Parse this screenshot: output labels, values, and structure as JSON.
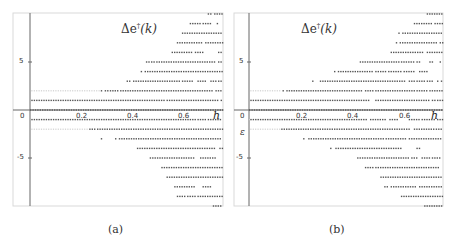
{
  "chart_data": [
    {
      "type": "scatter",
      "panel": "a",
      "title": "Δe†(k)",
      "xlabel": "h",
      "ylabel": "",
      "caption": "(a)",
      "xlim": [
        0,
        0.75
      ],
      "ylim": [
        -10,
        10
      ],
      "x_ticks": [
        "0.2",
        "0.4",
        "0.6"
      ],
      "y_ticks": [
        "5",
        "0",
        "-5"
      ],
      "grid": false,
      "description": "Horizontal rows of dots at integer levels; each row lists h-intervals where dots are present",
      "rows": [
        {
          "level": 10,
          "segments": [
            [
              0.69,
              0.705
            ],
            [
              0.715,
              0.75
            ]
          ]
        },
        {
          "level": 9,
          "segments": [
            [
              0.62,
              0.66
            ],
            [
              0.67,
              0.705
            ],
            [
              0.725,
              0.73
            ]
          ]
        },
        {
          "level": 8,
          "segments": [
            [
              0.59,
              0.75
            ]
          ]
        },
        {
          "level": 7,
          "segments": [
            [
              0.57,
              0.67
            ],
            [
              0.68,
              0.75
            ]
          ]
        },
        {
          "level": 6,
          "segments": [
            [
              0.55,
              0.63
            ],
            [
              0.64,
              0.67
            ],
            [
              0.73,
              0.75
            ]
          ]
        },
        {
          "level": 5,
          "segments": [
            [
              0.45,
              0.46
            ],
            [
              0.47,
              0.48
            ],
            [
              0.49,
              0.72
            ],
            [
              0.73,
              0.75
            ]
          ]
        },
        {
          "level": 4,
          "segments": [
            [
              0.43,
              0.435
            ],
            [
              0.445,
              0.75
            ]
          ]
        },
        {
          "level": 3,
          "segments": [
            [
              0.375,
              0.39
            ],
            [
              0.4,
              0.58
            ],
            [
              0.59,
              0.63
            ],
            [
              0.65,
              0.68
            ],
            [
              0.7,
              0.72
            ],
            [
              0.73,
              0.75
            ]
          ]
        },
        {
          "level": 2,
          "segments": [
            [
              0.275,
              0.28
            ],
            [
              0.29,
              0.3
            ],
            [
              0.31,
              0.34
            ],
            [
              0.35,
              0.71
            ],
            [
              0.72,
              0.75
            ]
          ]
        },
        {
          "level": 1,
          "segments": [
            [
              0.005,
              0.52
            ],
            [
              0.53,
              0.73
            ],
            [
              0.74,
              0.75
            ]
          ]
        },
        {
          "level": 0,
          "segments": [
            [
              0.0,
              0.75
            ]
          ]
        },
        {
          "level": -1,
          "segments": [
            [
              0.005,
              0.64
            ],
            [
              0.65,
              0.68
            ],
            [
              0.69,
              0.75
            ]
          ]
        },
        {
          "level": -2,
          "segments": [
            [
              0.23,
              0.25
            ],
            [
              0.26,
              0.75
            ]
          ]
        },
        {
          "level": -3,
          "segments": [
            [
              0.275,
              0.28
            ],
            [
              0.33,
              0.335
            ],
            [
              0.345,
              0.75
            ]
          ]
        },
        {
          "level": -4,
          "segments": [
            [
              0.415,
              0.72
            ],
            [
              0.735,
              0.75
            ]
          ]
        },
        {
          "level": -5,
          "segments": [
            [
              0.465,
              0.64
            ],
            [
              0.66,
              0.72
            ]
          ]
        },
        {
          "level": -6,
          "segments": [
            [
              0.51,
              0.75
            ]
          ]
        },
        {
          "level": -7,
          "segments": [
            [
              0.53,
              0.75
            ]
          ]
        },
        {
          "level": -8,
          "segments": [
            [
              0.56,
              0.64
            ],
            [
              0.67,
              0.7
            ]
          ]
        },
        {
          "level": -9,
          "segments": [
            [
              0.57,
              0.6
            ],
            [
              0.61,
              0.64
            ],
            [
              0.65,
              0.75
            ]
          ]
        },
        {
          "level": -10,
          "segments": [
            [
              0.71,
              0.75
            ]
          ]
        }
      ],
      "faint_rows": [
        {
          "level": 2,
          "segments": [
            [
              0.005,
              0.27
            ]
          ]
        },
        {
          "level": -2,
          "segments": [
            [
              0.005,
              0.22
            ]
          ]
        }
      ]
    },
    {
      "type": "scatter",
      "panel": "b",
      "title": "Δe†(k)",
      "xlabel": "h",
      "ylabel": "",
      "caption": "(b)",
      "extra_label": "ε",
      "xlim": [
        0,
        0.75
      ],
      "ylim": [
        -10,
        10
      ],
      "x_ticks": [
        "0.2",
        "0.4",
        "0.6"
      ],
      "y_ticks": [
        "5",
        "0",
        "-5"
      ],
      "grid": false,
      "rows": [
        {
          "level": 10,
          "segments": [
            [
              0.69,
              0.75
            ]
          ]
        },
        {
          "level": 9,
          "segments": [
            [
              0.64,
              0.71
            ],
            [
              0.72,
              0.75
            ]
          ]
        },
        {
          "level": 8,
          "segments": [
            [
              0.58,
              0.585
            ],
            [
              0.595,
              0.75
            ]
          ]
        },
        {
          "level": 7,
          "segments": [
            [
              0.57,
              0.575
            ],
            [
              0.585,
              0.73
            ],
            [
              0.74,
              0.75
            ]
          ]
        },
        {
          "level": 6,
          "segments": [
            [
              0.55,
              0.68
            ],
            [
              0.69,
              0.75
            ]
          ]
        },
        {
          "level": 5,
          "segments": [
            [
              0.43,
              0.58
            ],
            [
              0.59,
              0.64
            ],
            [
              0.65,
              0.66
            ],
            [
              0.7,
              0.71
            ],
            [
              0.74,
              0.745
            ]
          ]
        },
        {
          "level": 4,
          "segments": [
            [
              0.33,
              0.335
            ],
            [
              0.345,
              0.48
            ],
            [
              0.49,
              0.53
            ],
            [
              0.54,
              0.59
            ],
            [
              0.6,
              0.64
            ],
            [
              0.66,
              0.69
            ]
          ]
        },
        {
          "level": 3,
          "segments": [
            [
              0.245,
              0.25
            ],
            [
              0.275,
              0.61
            ],
            [
              0.62,
              0.64
            ],
            [
              0.65,
              0.68
            ],
            [
              0.69,
              0.71
            ],
            [
              0.73,
              0.735
            ],
            [
              0.745,
              0.75
            ]
          ]
        },
        {
          "level": 2,
          "segments": [
            [
              0.13,
              0.135
            ],
            [
              0.145,
              0.44
            ],
            [
              0.45,
              0.48
            ],
            [
              0.49,
              0.64
            ],
            [
              0.65,
              0.69
            ],
            [
              0.7,
              0.75
            ]
          ]
        },
        {
          "level": 1,
          "segments": [
            [
              0.005,
              0.47
            ],
            [
              0.49,
              0.7
            ],
            [
              0.71,
              0.72
            ],
            [
              0.73,
              0.75
            ]
          ]
        },
        {
          "level": 0,
          "segments": [
            [
              0.0,
              0.75
            ]
          ]
        },
        {
          "level": -1,
          "segments": [
            [
              0.005,
              0.46
            ],
            [
              0.47,
              0.53
            ],
            [
              0.545,
              0.58
            ],
            [
              0.62,
              0.66
            ],
            [
              0.67,
              0.72
            ],
            [
              0.73,
              0.75
            ]
          ]
        },
        {
          "level": -2,
          "segments": [
            [
              0.125,
              0.62
            ],
            [
              0.64,
              0.72
            ],
            [
              0.725,
              0.75
            ]
          ]
        },
        {
          "level": -3,
          "segments": [
            [
              0.21,
              0.215
            ],
            [
              0.23,
              0.52
            ],
            [
              0.53,
              0.61
            ],
            [
              0.62,
              0.75
            ]
          ]
        },
        {
          "level": -4,
          "segments": [
            [
              0.315,
              0.32
            ],
            [
              0.335,
              0.59
            ],
            [
              0.65,
              0.665
            ]
          ]
        },
        {
          "level": -5,
          "segments": [
            [
              0.42,
              0.62
            ],
            [
              0.63,
              0.65
            ],
            [
              0.67,
              0.7
            ],
            [
              0.71,
              0.74
            ]
          ]
        },
        {
          "level": -6,
          "segments": [
            [
              0.45,
              0.48
            ],
            [
              0.49,
              0.74
            ],
            [
              0.75,
              0.75
            ]
          ]
        },
        {
          "level": -7,
          "segments": [
            [
              0.51,
              0.75
            ]
          ]
        },
        {
          "level": -8,
          "segments": [
            [
              0.525,
              0.54
            ],
            [
              0.55,
              0.65
            ],
            [
              0.66,
              0.75
            ]
          ]
        },
        {
          "level": -9,
          "segments": [
            [
              0.59,
              0.75
            ]
          ]
        },
        {
          "level": -10,
          "segments": [
            [
              0.68,
              0.75
            ]
          ]
        }
      ],
      "faint_rows": [
        {
          "level": 2,
          "segments": [
            [
              0.005,
              0.12
            ]
          ]
        },
        {
          "level": -1,
          "segments": [
            [
              0.0,
              0.0
            ]
          ]
        },
        {
          "level": -2,
          "segments": [
            [
              0.005,
              0.12
            ]
          ]
        }
      ]
    }
  ],
  "panels": {
    "a": {
      "title_main": "Δe",
      "title_sup": "†",
      "title_arg": "(k)",
      "xlabel": "h",
      "caption": "(a)",
      "tick_x": [
        "0.2",
        "0.4",
        "0.6"
      ],
      "tick_y5": "5",
      "tick_y0": "0",
      "tick_yn5": "-5"
    },
    "b": {
      "title_main": "Δe",
      "title_sup": "†",
      "title_arg": "(k)",
      "xlabel": "h",
      "caption": "(b)",
      "eps_label": "ε",
      "tick_x": [
        "0.2",
        "0.4",
        "0.6"
      ],
      "tick_y5": "5",
      "tick_y0": "0",
      "tick_yn5": "-5"
    }
  },
  "colors": {
    "dots": "#555555",
    "faint_dots": "#cfcfcf",
    "axis": "#666666",
    "frame": "#d9d9d9"
  }
}
